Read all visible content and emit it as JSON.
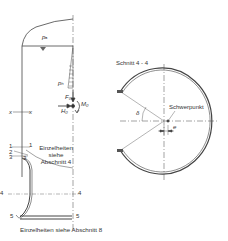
{
  "diagram": {
    "type": "technical-drawing",
    "colors": {
      "line": "#444444",
      "background": "#ffffff",
      "fill": "#888888"
    },
    "left_view": {
      "labels": {
        "p_top": "pₐ",
        "p_side": "pₕ",
        "force_f": "F₀",
        "force_h": "H₀",
        "moment": "M₀",
        "section_x_left": "x",
        "section_x_right": "x",
        "marker_1_left": "1",
        "marker_1_right": "1",
        "marker_2": "2",
        "marker_3_left": "3",
        "marker_3_right": "3",
        "marker_4_left": "4",
        "marker_4_right": "4",
        "marker_5_left": "5",
        "marker_5_right": "5",
        "details_note_line1": "Einzelheiten",
        "details_note_line2": "siehe",
        "details_note_line3": "Abschnitt 4",
        "bottom_note": "Einzelheiten siehe Abschnitt 8"
      }
    },
    "right_view": {
      "title": "Schnitt 4 - 4",
      "centroid_label": "Schwerpunkt",
      "angle_label": "δ",
      "offset_label": "e"
    }
  }
}
